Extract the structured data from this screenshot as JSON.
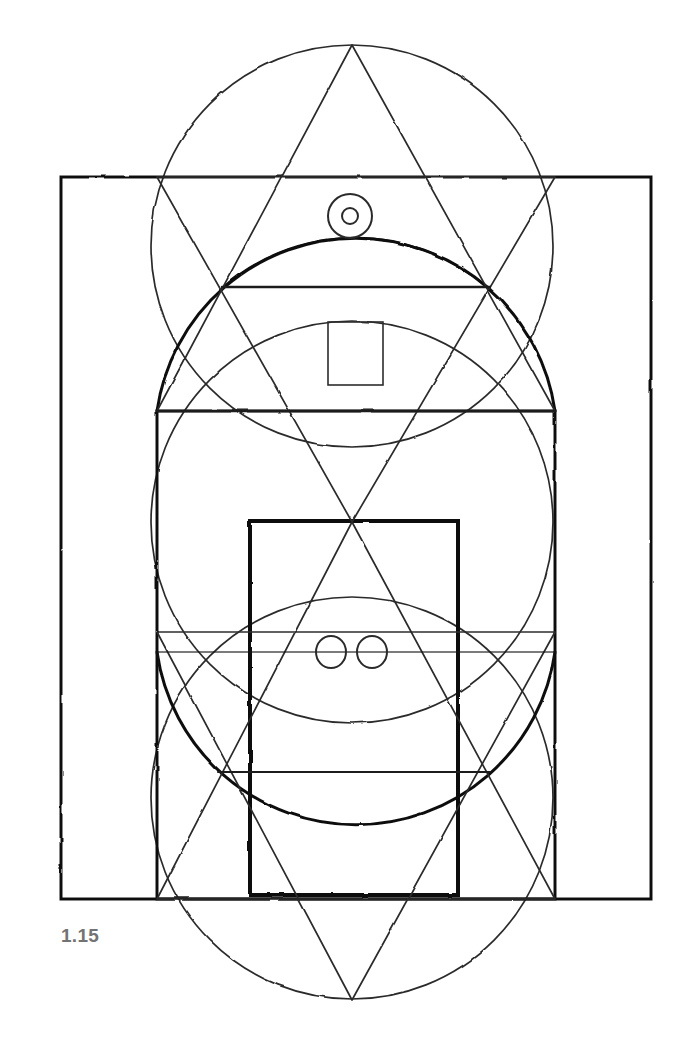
{
  "figure": {
    "caption": "1.15",
    "caption_color": "#737373",
    "background_color": "#ffffff",
    "ink_color": "#1a1a1a",
    "ink_color_light": "#4a4a4a",
    "medium": "hand-drawn pencil geometric construction",
    "canvas": {
      "width": 690,
      "height": 1043
    }
  },
  "chart_data": {
    "type": "diagram",
    "title": "1.15",
    "circles": [
      {
        "name": "upper-circle",
        "cx": 352,
        "cy": 246,
        "r": 201
      },
      {
        "name": "middle-circle",
        "cx": 352,
        "cy": 522,
        "r": 201
      },
      {
        "name": "lower-circle",
        "cx": 352,
        "cy": 798,
        "r": 201
      },
      {
        "name": "detail-ring-outer",
        "cx": 350,
        "cy": 216,
        "r": 22
      },
      {
        "name": "detail-ring-inner",
        "cx": 350,
        "cy": 216,
        "r": 8
      },
      {
        "name": "eye-circle-left",
        "cx": 331,
        "cy": 652,
        "r": 15
      },
      {
        "name": "eye-circle-right",
        "cx": 372,
        "cy": 652,
        "r": 15
      }
    ],
    "rectangles": [
      {
        "name": "outer-frame",
        "x": 61,
        "y": 177,
        "width": 590,
        "height": 722,
        "stroke": 3
      },
      {
        "name": "middle-frame",
        "x": 157,
        "y": 411,
        "width": 398,
        "height": 484,
        "stroke": 3
      },
      {
        "name": "inner-frame",
        "x": 250,
        "y": 521,
        "width": 208,
        "height": 374,
        "stroke": 4
      },
      {
        "name": "small-square",
        "x": 328,
        "y": 322,
        "width": 55,
        "height": 63,
        "stroke": 1.6
      }
    ],
    "triangles": [
      {
        "name": "upper-triangle",
        "points": "352,45 157,411 555,411"
      },
      {
        "name": "lower-triangle",
        "points": "352,1000 157,632 555,632"
      },
      {
        "name": "upper-inner-triangle",
        "points": "352,522 157,177 555,177"
      },
      {
        "name": "lower-inner-triangle",
        "points": "352,522 157,899 555,899"
      }
    ],
    "horizontal_lines": [
      {
        "name": "chord-upper",
        "y": 287,
        "x1": 222,
        "x2": 490
      },
      {
        "name": "chord-waist",
        "y": 411,
        "x1": 157,
        "x2": 555
      },
      {
        "name": "chord-axis",
        "y": 652,
        "x1": 157,
        "x2": 555
      },
      {
        "name": "chord-lower",
        "y": 772,
        "x1": 218,
        "x2": 490
      }
    ],
    "marks": [
      {
        "name": "registration-tick",
        "x": 511,
        "y1": 1010,
        "y2": 1043
      }
    ],
    "axis": {
      "name": "vertical-centre-axis",
      "x": 352
    }
  }
}
